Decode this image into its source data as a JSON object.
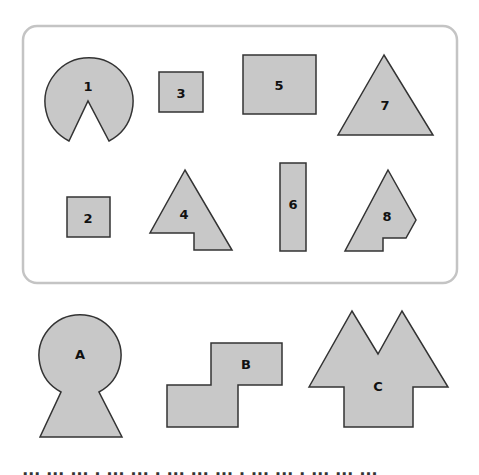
{
  "panel": {
    "shapes": [
      {
        "id": "1",
        "label": "1",
        "kind": "circle-with-notch"
      },
      {
        "id": "3",
        "label": "3",
        "kind": "square"
      },
      {
        "id": "5",
        "label": "5",
        "kind": "rectangle"
      },
      {
        "id": "7",
        "label": "7",
        "kind": "triangle"
      },
      {
        "id": "2",
        "label": "2",
        "kind": "square"
      },
      {
        "id": "4",
        "label": "4",
        "kind": "triangle-with-notch"
      },
      {
        "id": "6",
        "label": "6",
        "kind": "tall-rectangle"
      },
      {
        "id": "8",
        "label": "8",
        "kind": "irregular-pentagon-with-notch"
      }
    ]
  },
  "targets": [
    {
      "id": "A",
      "label": "A",
      "kind": "keyhole"
    },
    {
      "id": "B",
      "label": "B",
      "kind": "step-shape"
    },
    {
      "id": "C",
      "label": "C",
      "kind": "double-peak-house"
    }
  ],
  "colors": {
    "shape_fill": "#c8c8c8",
    "shape_stroke": "#333333",
    "panel_border": "#c4c4c4"
  },
  "footer": {
    "cut_text": "▮▮▮ ▮▮▮ ▮▮▮ ▮ ▮▮▮ ▮▮▮ ▮ ▮▮▮ ▮▮▮ ▮▮▮ ▮ ▮▮▮ ▮▮▮ ▮ ▮▮▮ ▮▮▮ ▮▮▮ ▮ ▮▮▮ ▮▮▮ ▮"
  }
}
